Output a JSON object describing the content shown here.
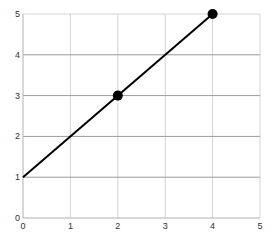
{
  "chart_data": {
    "type": "line",
    "title": "",
    "xlabel": "",
    "ylabel": "",
    "xlim": [
      0,
      5
    ],
    "ylim": [
      0,
      5
    ],
    "grid": true,
    "legend": null,
    "x_ticks": [
      "0",
      "1",
      "2",
      "3",
      "4",
      "5"
    ],
    "y_ticks": [
      "0",
      "1",
      "2",
      "3",
      "4",
      "5"
    ],
    "series": [
      {
        "name": "line",
        "x": [
          0,
          4
        ],
        "y": [
          1,
          5
        ],
        "color": "#000000"
      }
    ],
    "markers": [
      {
        "x": 2,
        "y": 3,
        "color": "#000000"
      },
      {
        "x": 4,
        "y": 5,
        "color": "#000000"
      }
    ]
  },
  "colors": {
    "background": "#ffffff",
    "grid_horizontal": "#9a9a9a",
    "grid_vertical": "#d4d4d4",
    "axis": "#b0b0b0",
    "line": "#000000",
    "marker": "#000000",
    "tick_text": "#333333"
  },
  "layout": {
    "plot_left": 23,
    "plot_right": 260,
    "plot_top": 14,
    "plot_bottom": 218
  }
}
